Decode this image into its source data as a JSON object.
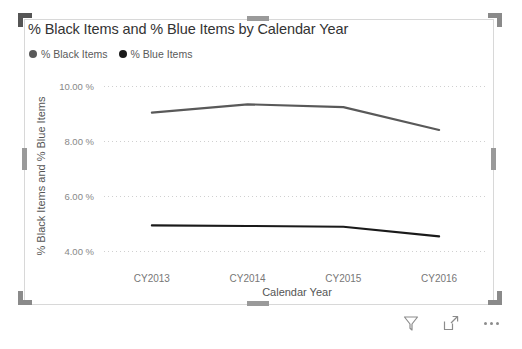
{
  "visual": {
    "title": "% Black Items and % Blue Items by Calendar Year",
    "selected": "true"
  },
  "legend": {
    "items": [
      {
        "label": "% Black Items",
        "color": "#595959"
      },
      {
        "label": "% Blue Items",
        "color": "#1a1a1a"
      }
    ]
  },
  "footer": {
    "filter_label": "Filters",
    "focus_label": "Focus mode",
    "more_label": "More options"
  },
  "chart_data": {
    "type": "line",
    "title": "% Black Items and % Blue Items by Calendar Year",
    "xlabel": "Calendar Year",
    "ylabel": "% Black Items and % Blue Items",
    "categories": [
      "CY2013",
      "CY2014",
      "CY2015",
      "CY2016"
    ],
    "ylim": [
      3.4,
      10.6
    ],
    "yticks": [
      4,
      6,
      8,
      10
    ],
    "ytick_labels": [
      "4.00 %",
      "6.00 %",
      "8.00 %",
      "10.00 %"
    ],
    "grid": "horizontal-dotted",
    "legend_position": "top-left",
    "series": [
      {
        "name": "% Black Items",
        "color": "#595959",
        "values": [
          9.05,
          9.35,
          9.25,
          8.42
        ]
      },
      {
        "name": "% Blue Items",
        "color": "#1a1a1a",
        "values": [
          4.95,
          4.93,
          4.9,
          4.55
        ]
      }
    ]
  }
}
